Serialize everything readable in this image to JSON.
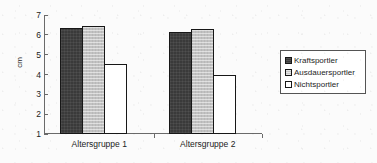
{
  "chart_data": {
    "type": "bar",
    "title": "",
    "subtitle": "",
    "xlabel": "",
    "ylabel": "cm",
    "categories": [
      "Altersgruppe 1",
      "Altersgruppe 2"
    ],
    "series": [
      {
        "name": "Kraftsportler",
        "values": [
          6.35,
          6.15
        ],
        "color": "#3a3a3a",
        "swatch": "dark-filled"
      },
      {
        "name": "Ausdauersportler",
        "values": [
          6.45,
          6.3
        ],
        "color": "#c2c2c2",
        "swatch": "light-gray"
      },
      {
        "name": "Nichtsportler",
        "values": [
          4.55,
          4.0
        ],
        "color": "#ffffff",
        "swatch": "white-outline"
      }
    ],
    "ylim": [
      1,
      7
    ],
    "ytick_labels": [
      "7",
      "6",
      "5",
      "4",
      "3",
      "2",
      "1"
    ],
    "ytick_values": [
      7,
      6,
      5,
      4,
      3,
      2,
      1
    ],
    "grid": false,
    "legend_position": "right"
  },
  "legend": {
    "entries": [
      {
        "label": "Kraftsportler"
      },
      {
        "label": "Ausdauersportler"
      },
      {
        "label": "Nichtsportler"
      }
    ]
  },
  "axes": {
    "y_title": "cm"
  }
}
